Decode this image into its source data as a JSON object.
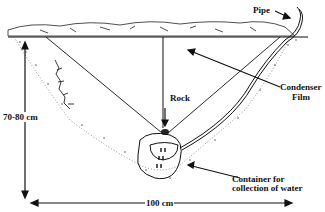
{
  "labels": {
    "pipe": "Pipe",
    "rock": "Rock",
    "condenser_line1": "Condenser",
    "condenser_line2": "Film",
    "depth": "70-80 cm",
    "container_line1": "Container for",
    "container_line2": "collection of water",
    "width": "100 cm"
  },
  "colors": {
    "ink": "#111111",
    "background": "#ffffff"
  }
}
